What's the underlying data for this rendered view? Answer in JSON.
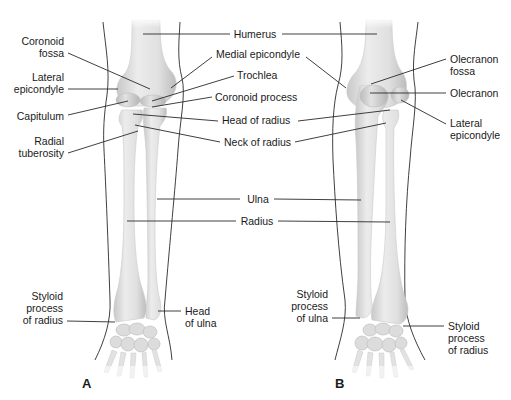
{
  "figure": {
    "type": "anatomical-diagram",
    "panels": [
      {
        "id": "A",
        "label": "A",
        "view": "anterior",
        "left_labels": {
          "coronoid_fossa": [
            "Coronoid",
            "fossa"
          ],
          "lateral_epicondyle": [
            "Lateral",
            "epicondyle"
          ],
          "capitulum": [
            "Capitulum"
          ],
          "radial_tuberosity": [
            "Radial",
            "tuberosity"
          ],
          "styloid_process_of_radius": [
            "Styloid",
            "process",
            "of radius"
          ]
        },
        "right_labels": {
          "head_of_ulna": [
            "Head",
            "of ulna"
          ]
        }
      },
      {
        "id": "B",
        "label": "B",
        "view": "posterior",
        "right_labels": {
          "olecranon_fossa": [
            "Olecranon",
            "fossa"
          ],
          "olecranon": [
            "Olecranon"
          ],
          "lateral_epicondyle": [
            "Lateral",
            "epicondyle"
          ],
          "styloid_process_of_radius": [
            "Styloid",
            "process",
            "of radius"
          ]
        },
        "left_labels": {
          "styloid_process_of_ulna": [
            "Styloid",
            "process",
            "of ulna"
          ]
        }
      }
    ],
    "center_labels": {
      "humerus": "Humerus",
      "medial_epicondyle": "Medial epicondyle",
      "trochlea": "Trochlea",
      "coronoid_process": "Coronoid process",
      "head_of_radius": "Head of radius",
      "neck_of_radius": "Neck of radius",
      "ulna": "Ulna",
      "radius": "Radius"
    },
    "colors": {
      "bone_light": "#ececec",
      "bone_shade": "#c4c4c4",
      "line": "#2a2a2a",
      "text": "#1a1a1a",
      "background": "#ffffff"
    }
  }
}
